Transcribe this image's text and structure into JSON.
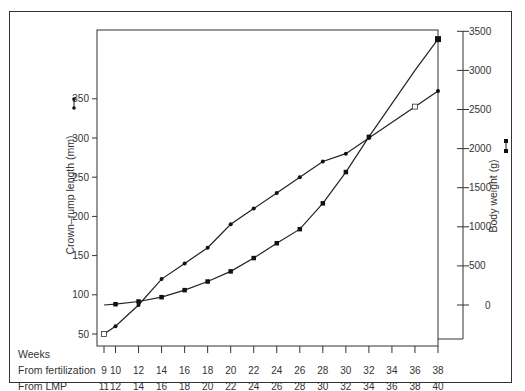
{
  "chart_data": {
    "type": "line",
    "title": "",
    "x_row_labels": {
      "header": "Weeks",
      "fertilization_label": "From fertilization",
      "lmp_label": "From LMP"
    },
    "x_fertilization": [
      9,
      10,
      12,
      14,
      16,
      18,
      20,
      22,
      24,
      26,
      28,
      30,
      32,
      34,
      36,
      38
    ],
    "x_lmp": [
      11,
      12,
      14,
      16,
      18,
      20,
      22,
      24,
      26,
      28,
      30,
      32,
      34,
      36,
      38,
      40
    ],
    "y_left": {
      "label": "Crown–rump length (mm)",
      "ticks": [
        50,
        100,
        150,
        200,
        250,
        300,
        350
      ],
      "range": [
        50,
        390
      ]
    },
    "y_right": {
      "label": "Body weight (g)",
      "ticks": [
        0,
        500,
        1000,
        1500,
        2000,
        2500,
        3000,
        3500
      ],
      "range": [
        0,
        3500
      ]
    },
    "series": [
      {
        "name": "Crown–rump length (mm)",
        "marker": "circle",
        "axis": "left",
        "x": [
          9,
          10,
          12,
          14,
          16,
          18,
          20,
          22,
          24,
          26,
          28,
          30,
          32,
          36,
          38
        ],
        "values": [
          50,
          60,
          87,
          120,
          140,
          160,
          190,
          210,
          230,
          250,
          270,
          280,
          300,
          340,
          360
        ]
      },
      {
        "name": "Body weight (g)",
        "marker": "square",
        "axis": "right",
        "x": [
          9,
          10,
          12,
          14,
          16,
          18,
          20,
          22,
          24,
          26,
          28,
          30,
          32,
          36,
          38
        ],
        "values": [
          0,
          10,
          45,
          100,
          190,
          300,
          430,
          600,
          790,
          970,
          1300,
          1700,
          2150,
          3000,
          3400
        ]
      }
    ],
    "grid": false,
    "legend_position": "inline-with-axis-labels"
  }
}
